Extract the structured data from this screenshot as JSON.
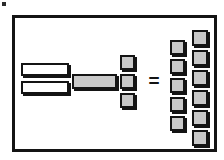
{
  "canvas": {
    "width": 224,
    "height": 160,
    "background": "#ffffff",
    "title": "Block multiplication diagram"
  },
  "corner_mark": {
    "label": "stray-mark",
    "color": "#2b2b2b",
    "x": 2,
    "y": 2,
    "w": 4,
    "h": 4
  },
  "panel": {
    "label": "diagram-frame",
    "border_color": "#141414",
    "fill": "#ffffff",
    "x": 12,
    "y": 15,
    "w": 205,
    "h": 137,
    "border_width": 3
  },
  "colors": {
    "outline": "#141414",
    "gray_fill": "#c9c9c9",
    "white_fill": "#ffffff",
    "shadow": "#141414"
  },
  "operator": {
    "label": "=",
    "name": "equals-sign",
    "x": 146,
    "y": 72
  },
  "groups": [
    {
      "name": "left-white-bars",
      "kind": "bar",
      "fill": "white",
      "count": 2,
      "blocks": [
        {
          "x": 21,
          "y": 63,
          "w": 48,
          "h": 13
        },
        {
          "x": 21,
          "y": 81,
          "w": 48,
          "h": 13
        }
      ]
    },
    {
      "name": "center-gray-bar",
      "kind": "bar",
      "fill": "gray",
      "count": 1,
      "blocks": [
        {
          "x": 72,
          "y": 74,
          "w": 45,
          "h": 15
        }
      ]
    },
    {
      "name": "center-gray-column",
      "kind": "square",
      "fill": "gray",
      "count": 3,
      "blocks": [
        {
          "x": 120,
          "y": 55,
          "w": 15,
          "h": 15
        },
        {
          "x": 120,
          "y": 74,
          "w": 15,
          "h": 15
        },
        {
          "x": 120,
          "y": 93,
          "w": 15,
          "h": 15
        }
      ]
    },
    {
      "name": "result-column-left",
      "kind": "square",
      "fill": "gray",
      "count": 5,
      "blocks": [
        {
          "x": 170,
          "y": 40,
          "w": 15,
          "h": 15
        },
        {
          "x": 170,
          "y": 59,
          "w": 15,
          "h": 15
        },
        {
          "x": 170,
          "y": 78,
          "w": 15,
          "h": 15
        },
        {
          "x": 170,
          "y": 97,
          "w": 15,
          "h": 15
        },
        {
          "x": 170,
          "y": 116,
          "w": 15,
          "h": 15
        }
      ]
    },
    {
      "name": "result-column-right",
      "kind": "square",
      "fill": "gray",
      "count": 6,
      "blocks": [
        {
          "x": 192,
          "y": 30,
          "w": 16,
          "h": 16
        },
        {
          "x": 192,
          "y": 50,
          "w": 16,
          "h": 16
        },
        {
          "x": 192,
          "y": 70,
          "w": 16,
          "h": 16
        },
        {
          "x": 192,
          "y": 90,
          "w": 16,
          "h": 16
        },
        {
          "x": 192,
          "y": 110,
          "w": 16,
          "h": 16
        },
        {
          "x": 192,
          "y": 130,
          "w": 16,
          "h": 16
        }
      ]
    }
  ]
}
